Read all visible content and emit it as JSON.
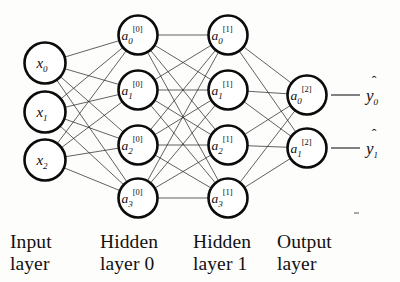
{
  "figure": {
    "kind": "neural-network-architecture-diagram",
    "background_color": "#fdfdfc",
    "ink_color": "#0d0d0d"
  },
  "geometry": {
    "width": 400,
    "height": 282,
    "node_radius": 19.5,
    "input_radius": 20.5,
    "output_radius": 19.5
  },
  "layers": [
    {
      "id": "input",
      "caption": "Input\nlayer",
      "caption_x": 10,
      "caption_y": 231,
      "cx": 45,
      "node_radius": 20.5,
      "nodes": [
        {
          "base": "x",
          "sub": "0",
          "sup": "",
          "cy": 63
        },
        {
          "base": "x",
          "sub": "1",
          "sup": "",
          "cy": 112
        },
        {
          "base": "x",
          "sub": "2",
          "sup": "",
          "cy": 160
        }
      ]
    },
    {
      "id": "hidden0",
      "caption": "Hidden\nlayer 0",
      "caption_x": 100,
      "caption_y": 231,
      "cx": 138,
      "node_radius": 19.5,
      "nodes": [
        {
          "base": "a",
          "sub": "0",
          "sup": "[0]",
          "cy": 35
        },
        {
          "base": "a",
          "sub": "1",
          "sup": "[0]",
          "cy": 90
        },
        {
          "base": "a",
          "sub": "2",
          "sup": "[0]",
          "cy": 145
        },
        {
          "base": "a",
          "sub": "3",
          "sup": "[0]",
          "cy": 198
        }
      ]
    },
    {
      "id": "hidden1",
      "caption": "Hidden\nlayer 1",
      "caption_x": 193,
      "caption_y": 231,
      "cx": 228,
      "node_radius": 19.5,
      "nodes": [
        {
          "base": "a",
          "sub": "0",
          "sup": "[1]",
          "cy": 35
        },
        {
          "base": "a",
          "sub": "1",
          "sup": "[1]",
          "cy": 90
        },
        {
          "base": "a",
          "sub": "2",
          "sup": "[1]",
          "cy": 145
        },
        {
          "base": "a",
          "sub": "3",
          "sup": "[1]",
          "cy": 198
        }
      ]
    },
    {
      "id": "output",
      "caption": "Output\nlayer",
      "caption_x": 277,
      "caption_y": 231,
      "cx": 307,
      "node_radius": 19.5,
      "nodes": [
        {
          "base": "a",
          "sub": "0",
          "sup": "[2]",
          "cy": 95
        },
        {
          "base": "a",
          "sub": "1",
          "sup": "[2]",
          "cy": 148
        }
      ]
    }
  ],
  "connections": [
    {
      "from": "input",
      "to": "hidden0",
      "fully_connected": true,
      "count": 12
    },
    {
      "from": "hidden0",
      "to": "hidden1",
      "fully_connected": true,
      "count": 16
    },
    {
      "from": "hidden1",
      "to": "output",
      "fully_connected": true,
      "count": 8
    }
  ],
  "outputs": [
    {
      "base": "y",
      "sub": "0",
      "hat": "ˆ",
      "x": 375,
      "cy": 95,
      "stub_from": 331,
      "stub_to": 360
    },
    {
      "base": "y",
      "sub": "1",
      "hat": "ˆ",
      "x": 375,
      "cy": 148,
      "stub_from": 331,
      "stub_to": 360
    }
  ],
  "artifacts": [
    {
      "name": "scan-speck",
      "x": 354,
      "y": 212
    }
  ]
}
